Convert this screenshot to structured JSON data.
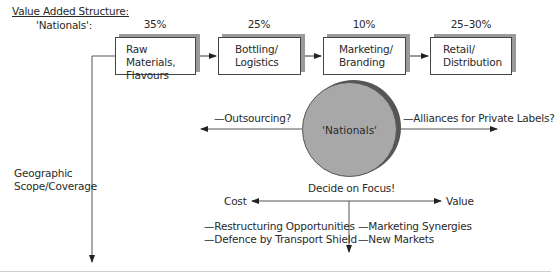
{
  "header": {
    "title": "Value Added Structure:",
    "subtitle": "'Nationals':"
  },
  "value_chain": [
    {
      "percent": "35%",
      "line1": "Raw Materials,",
      "line2": "Flavours"
    },
    {
      "percent": "25%",
      "line1": "Bottling/",
      "line2": "Logistics"
    },
    {
      "percent": "10%",
      "line1": "Marketing/",
      "line2": "Branding"
    },
    {
      "percent": "25–30%",
      "line1": "Retail/",
      "line2": "Distribution"
    }
  ],
  "center": {
    "label": "'Nationals'",
    "left_option": "—Outsourcing?",
    "right_option": "—Alliances for Private Labels?"
  },
  "axis": {
    "vertical_label_line1": "Geographic",
    "vertical_label_line2": "Scope/Coverage"
  },
  "focus": {
    "title": "Decide on Focus!",
    "left_end": "Cost",
    "right_end": "Value",
    "cost_points": [
      "—Restructuring Opportunities",
      "—Defence by Transport Shield"
    ],
    "value_points": [
      "—Marketing Synergies",
      "—New Markets"
    ]
  }
}
